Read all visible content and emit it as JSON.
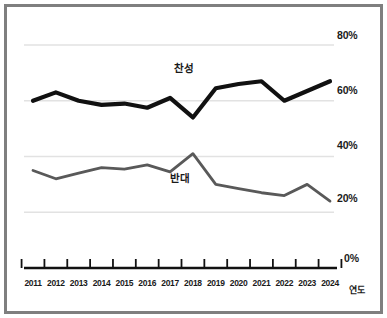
{
  "chart_data": {
    "type": "line",
    "title": "",
    "subtitle": "",
    "xlabel": "연도",
    "ylabel": "",
    "grid": true,
    "legend_position": "inline-annotation",
    "x": [
      "2011",
      "2012",
      "2013",
      "2014",
      "2015",
      "2016",
      "2017",
      "2018",
      "2019",
      "2020",
      "2021",
      "2022",
      "2023",
      "2024"
    ],
    "categories": [
      "2011",
      "2012",
      "2013",
      "2014",
      "2015",
      "2016",
      "2017",
      "2018",
      "2019",
      "2020",
      "2021",
      "2022",
      "2023",
      "2024"
    ],
    "ylim": [
      0,
      80
    ],
    "yticks": [
      0,
      20,
      40,
      60,
      80
    ],
    "ytick_labels": [
      "0%",
      "20%",
      "40%",
      "60%",
      "80%"
    ],
    "series": [
      {
        "name": "찬성",
        "color": "#111111",
        "width": 4.2,
        "values": [
          60,
          63,
          60,
          58.5,
          59,
          57.5,
          61,
          54,
          64.5,
          66,
          67,
          60,
          63.5,
          67
        ]
      },
      {
        "name": "반대",
        "color": "#595959",
        "width": 2.8,
        "values": [
          35,
          32,
          34,
          36,
          35.5,
          37,
          34.5,
          41,
          30,
          28.5,
          27,
          26,
          30,
          24
        ]
      }
    ],
    "annotations": [
      {
        "text": "찬성",
        "x": "2017",
        "y": 70
      },
      {
        "text": "반대",
        "x": "2017",
        "y": 29
      }
    ]
  },
  "axis": {
    "y_tick_80": "80%",
    "y_tick_60": "60%",
    "y_tick_40": "40%",
    "y_tick_20": "20%",
    "y_tick_0": "0%",
    "x_axis_title": "연도",
    "x_ticks": [
      "2011",
      "2012",
      "2013",
      "2014",
      "2015",
      "2016",
      "2017",
      "2018",
      "2019",
      "2020",
      "2021",
      "2022",
      "2023",
      "2024"
    ]
  },
  "labels": {
    "series_for": "찬성",
    "series_against": "반대"
  },
  "colors": {
    "frame": "#7f7f7f",
    "background": "#ffffff",
    "grid": "#e2e2e2",
    "axis": "#111111",
    "series_for": "#111111",
    "series_against": "#595959",
    "text": "#1a1a1a"
  }
}
